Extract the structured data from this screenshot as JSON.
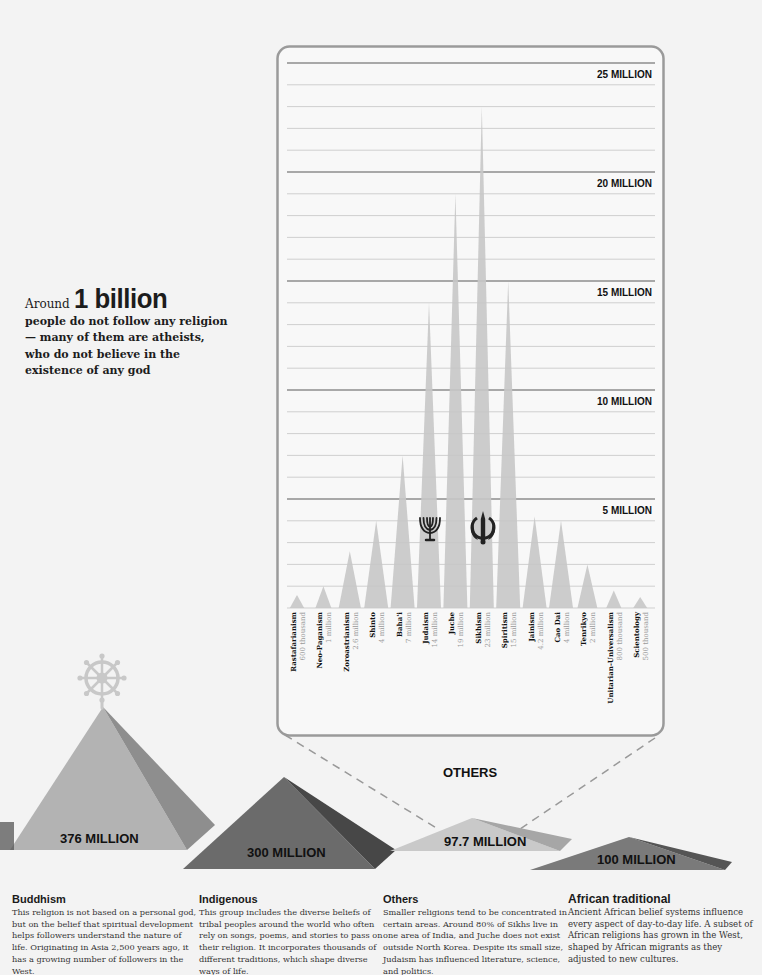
{
  "callout": {
    "lead": "Around",
    "big": "1 billion",
    "body": "people do not follow any religion— many of them are atheists, who do not believe in the existence of any god"
  },
  "chart_data": {
    "type": "area",
    "title": "Others",
    "subtitle": "",
    "xlabel": "",
    "ylabel": "",
    "ylim": [
      0,
      25000000
    ],
    "y_ticks": [
      {
        "value": 5000000,
        "label": "5 MILLION"
      },
      {
        "value": 10000000,
        "label": "10 MILLION"
      },
      {
        "value": 15000000,
        "label": "15 MILLION"
      },
      {
        "value": 20000000,
        "label": "20 MILLION"
      },
      {
        "value": 25000000,
        "label": "25 MILLION"
      }
    ],
    "grid": true,
    "categories": [
      "Rastafarianism",
      "Neo-Paganism",
      "Zoroastrianism",
      "Shinto",
      "Baha'i",
      "Judaism",
      "Juche",
      "Sikhism",
      "Spiritism",
      "Jainism",
      "Cao Dai",
      "Tenrikyo",
      "Unitarian-Universalism",
      "Scientology"
    ],
    "value_labels": [
      "600 thousand",
      "1 million",
      "2.6 million",
      "4 million",
      "7 million",
      "14 million",
      "19 million",
      "23 million",
      "15 million",
      "4.2 million",
      "4 million",
      "2 million",
      "800 thousand",
      "500 thousand"
    ],
    "values": [
      600000,
      1000000,
      2600000,
      4000000,
      7000000,
      14000000,
      19000000,
      23000000,
      15000000,
      4200000,
      4000000,
      2000000,
      800000,
      500000
    ],
    "annotations": [
      {
        "category": "Judaism",
        "icon": "menorah-icon"
      },
      {
        "category": "Sikhism",
        "icon": "khanda-icon"
      }
    ]
  },
  "pyramids": [
    {
      "name": "Buddhism",
      "label": "376 MILLION",
      "value": 376000000,
      "icon": "dharma-wheel-icon"
    },
    {
      "name": "Indigenous",
      "label": "300 MILLION",
      "value": 300000000
    },
    {
      "name": "Others",
      "label": "97.7 MILLION",
      "value": 97700000,
      "caption": "OTHERS"
    },
    {
      "name": "African traditional",
      "label": "100 MILLION",
      "value": 100000000
    }
  ],
  "columns": [
    {
      "title": "Buddhism",
      "text": "This religion is not based on a personal god, but on the belief that spiritual development helps followers understand the nature of life. Originating in Asia 2,500 years ago, it has a growing number of followers in the West."
    },
    {
      "title": "Indigenous",
      "text": "This group includes the diverse beliefs of tribal peoples around the world who often rely on songs, poems, and stories to pass on their religion. It incorporates thousands of different traditions, which shape diverse ways of life."
    },
    {
      "title": "Others",
      "text": "Smaller religions tend to be concentrated in certain areas. Around 80% of Sikhs live in one area of India, and Juche does not exist outside North Korea. Despite its small size, Judaism has influenced literature, science, and politics."
    },
    {
      "title": "African traditional",
      "text": "Ancient African belief systems influence every aspect of day-to-day life. A subset of African religions has grown in the West, shaped by African migrants as they adjusted to new cultures."
    }
  ]
}
